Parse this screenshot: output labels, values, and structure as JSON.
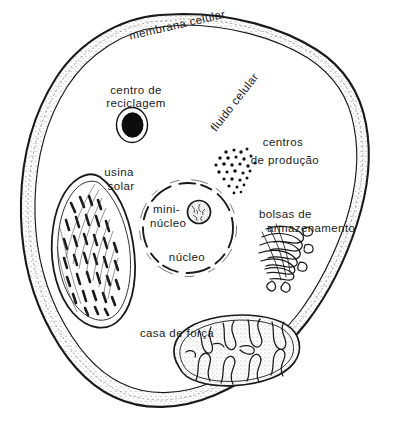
{
  "figure": {
    "background_color": "#ffffff",
    "ink_color": "#1a1a1a",
    "width": 398,
    "height": 435
  },
  "labels": {
    "membrana": "membrana celular",
    "fluido": "fluido celular",
    "reciclagem_line1": "centro de",
    "reciclagem_line2": "reciclagem",
    "centros_line1": "centros",
    "centros_line2": "de produção",
    "usina_line1": "usina",
    "usina_line2": "solar",
    "mini_line1": "mini-",
    "mini_line2": "núcleo",
    "nucleo": "núcleo",
    "bolsas_line1": "bolsas de",
    "bolsas_line2": "armazenamento",
    "casa": "casa de força"
  },
  "structures": [
    {
      "name": "cell-membrane",
      "label": "membrana celular"
    },
    {
      "name": "cytoplasm",
      "label": "fluido celular"
    },
    {
      "name": "lysosome",
      "label": "centro de reciclagem"
    },
    {
      "name": "ribosomes",
      "label": "centros de produção"
    },
    {
      "name": "chloroplast",
      "label": "usina solar"
    },
    {
      "name": "nucleolus",
      "label": "mini-núcleo"
    },
    {
      "name": "nucleus",
      "label": "núcleo"
    },
    {
      "name": "golgi-apparatus",
      "label": "bolsas de armazenamento"
    },
    {
      "name": "mitochondrion",
      "label": "casa de força"
    }
  ]
}
